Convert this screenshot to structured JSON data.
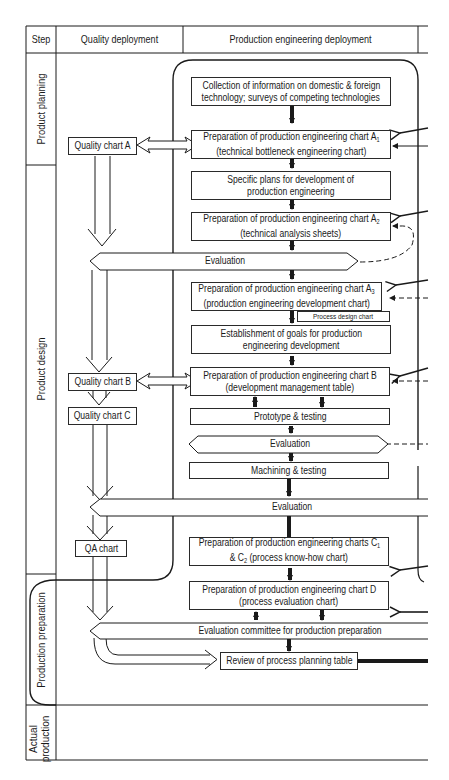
{
  "header": {
    "step": "Step",
    "quality_deployment": "Quality deployment",
    "production_engineering_deployment": "Production engineering deployment"
  },
  "steps": [
    {
      "label": "Product planning"
    },
    {
      "label": "Product design"
    },
    {
      "label": "Production preparation"
    },
    {
      "label": "Actual production",
      "line1": "Actual",
      "line2": "production"
    }
  ],
  "quality_charts": [
    {
      "label": "Quality chart A"
    },
    {
      "label": "Quality chart B"
    },
    {
      "label": "Quality chart C"
    },
    {
      "label": "QA chart"
    }
  ],
  "process_boxes": [
    {
      "line1": "Collection of information on domestic & foreign",
      "line2": "technology; surveys of competing technologies"
    },
    {
      "line1": "Preparation of production engineering chart A",
      "line1_sub": "1",
      "line2": "(technical bottleneck engineering chart)"
    },
    {
      "line1": "Specific plans for development of",
      "line2": "production engineering"
    },
    {
      "line1": "Preparation of production engineering chart A",
      "line1_sub": "2",
      "line2": "(technical analysis sheets)"
    },
    {
      "line1": "Preparation of production engineering chart A",
      "line1_sub": "3",
      "line2": "(production engineering development chart)"
    },
    {
      "line1": "Establishment of goals for production",
      "line2": "engineering development"
    },
    {
      "line1": "Preparation of production engineering chart B",
      "line2": "(development management table)"
    },
    {
      "line1": "Prototype & testing"
    },
    {
      "line1": "Machining & testing"
    },
    {
      "line1": "Preparation of production engineering charts C",
      "line1_sub": "1",
      "line2_pre": "& C",
      "line2_sub": "2",
      "line2": " (process know-how chart)"
    },
    {
      "line1": "Preparation of production engineering chart D",
      "line2": "(process evaluation chart)"
    },
    {
      "line1": "Review of process planning table"
    }
  ],
  "side_note": {
    "label": "Process design chart"
  },
  "evaluations": [
    {
      "label": "Evaluation"
    },
    {
      "label": "Evaluation"
    },
    {
      "label": "Evaluation"
    },
    {
      "label": "Evaluation committee for production preparation"
    }
  ],
  "colors": {
    "ink": "#1a1a1a",
    "paper": "#ffffff"
  }
}
